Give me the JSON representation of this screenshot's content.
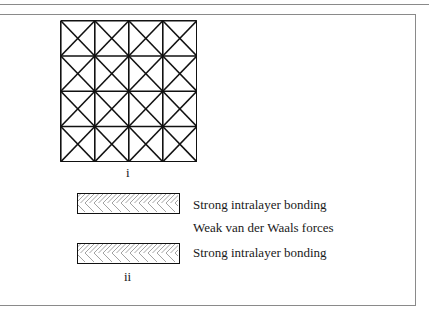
{
  "diagram": {
    "part_i": {
      "label": "i",
      "grid": {
        "rows": 4,
        "cols": 4,
        "cell_pattern": "square-with-both-diagonals"
      }
    },
    "part_ii": {
      "label": "ii",
      "layers": [
        {
          "type": "layer",
          "pattern": "herringbone-hatch",
          "text": "Strong intralayer bonding"
        },
        {
          "type": "gap",
          "text": "Weak van der Waals forces"
        },
        {
          "type": "layer",
          "pattern": "herringbone-hatch",
          "text": "Strong intralayer bonding"
        }
      ]
    },
    "colors": {
      "line": "#111111",
      "hatch": "#8c8c8c",
      "frame": "#8a8a8a"
    }
  }
}
